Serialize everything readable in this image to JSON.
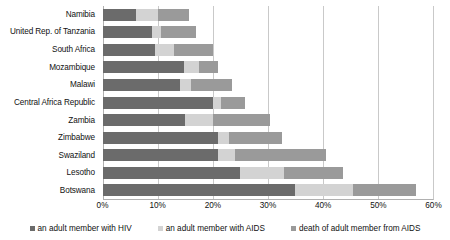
{
  "chart_data": {
    "type": "bar",
    "orientation": "horizontal",
    "stacked": true,
    "title": "",
    "xlabel": "",
    "ylabel": "",
    "xlim": [
      0,
      60
    ],
    "xtick_labels": [
      "0%",
      "10%",
      "20%",
      "30%",
      "40%",
      "50%",
      "60%"
    ],
    "xticks": [
      0,
      10,
      20,
      30,
      40,
      50,
      60
    ],
    "grid": true,
    "legend_position": "bottom",
    "categories": [
      "Namibia",
      "United Rep. of Tanzania",
      "South Africa",
      "Mozambique",
      "Malawi",
      "Central Africa Republic",
      "Zambia",
      "Zimbabwe",
      "Swaziland",
      "Lesotho",
      "Botswana"
    ],
    "series": [
      {
        "name": "an adult member with HIV",
        "color": "#6b6b6b",
        "values": [
          6.0,
          9.0,
          9.5,
          14.8,
          14.0,
          20.0,
          15.0,
          21.0,
          21.0,
          25.0,
          35.0
        ]
      },
      {
        "name": "an adult member with AIDS",
        "color": "#d3d3d3",
        "values": [
          4.0,
          1.6,
          3.5,
          2.7,
          2.0,
          1.6,
          5.0,
          2.0,
          3.0,
          8.0,
          10.5
        ]
      },
      {
        "name": "death of adult member from AIDS",
        "color": "#9a9a9a",
        "values": [
          5.8,
          6.4,
          7.0,
          3.5,
          7.5,
          4.4,
          10.5,
          9.7,
          16.7,
          10.8,
          11.5
        ]
      }
    ],
    "totals": [
      15.8,
      17.0,
      20.0,
      21.0,
      23.5,
      26.0,
      30.5,
      32.7,
      40.7,
      43.8,
      57.0
    ]
  },
  "legend": {
    "items": [
      {
        "label": "an adult member with HIV",
        "color": "#6b6b6b"
      },
      {
        "label": "an adult member with AIDS",
        "color": "#d3d3d3"
      },
      {
        "label": "death of adult member from AIDS",
        "color": "#9a9a9a"
      }
    ]
  }
}
